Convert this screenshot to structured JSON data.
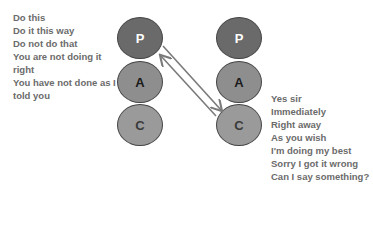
{
  "diagram": {
    "left_ego": {
      "parent": "P",
      "adult": "A",
      "child": "C"
    },
    "right_ego": {
      "parent": "P",
      "adult": "A",
      "child": "C"
    },
    "left_statements": [
      "Do this",
      "Do it this way",
      "Do not do that",
      "You are not doing it right",
      "You have not done as I told you"
    ],
    "right_statements": [
      "Yes sir",
      "Immediately",
      "Right away",
      "As you wish",
      "I'm doing my best",
      "Sorry I got it wrong",
      "Can I say something?"
    ],
    "arrows": [
      {
        "from": "left.P",
        "to": "right.C"
      },
      {
        "from": "right.C",
        "to": "left.P"
      }
    ],
    "colors": {
      "parent": "#6a6a6a",
      "adult": "#8e8e8e",
      "child": "#9a9a9a",
      "text": "#6b6b6b",
      "arrow": "#7a7a7a"
    }
  }
}
